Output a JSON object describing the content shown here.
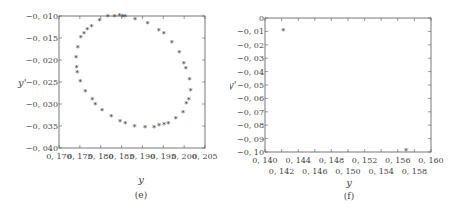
{
  "chart_data": [
    {
      "panel_label": "(e)",
      "type": "scatter",
      "title": "",
      "xlabel": "y",
      "ylabel": "y'",
      "xlim": [
        0.17,
        0.205
      ],
      "ylim": [
        -0.04,
        -0.01
      ],
      "xticks": [
        "0.170",
        "0.175",
        "0.180",
        "0.185",
        "0.190",
        "0.195",
        "0.200",
        "0.205"
      ],
      "yticks": [
        "-0.010",
        "-0.015",
        "-0.020",
        "-0.025",
        "-0.030",
        "-0.035",
        "-0.040"
      ],
      "grid": false,
      "marker": "*",
      "points": [
        [
          0.1741,
          -0.0195
        ],
        [
          0.1742,
          -0.0218
        ],
        [
          0.1744,
          -0.0229
        ],
        [
          0.1745,
          -0.0172
        ],
        [
          0.1752,
          -0.015
        ],
        [
          0.1751,
          -0.025
        ],
        [
          0.176,
          -0.014
        ],
        [
          0.1768,
          -0.0131
        ],
        [
          0.1763,
          -0.0273
        ],
        [
          0.1778,
          -0.0124
        ],
        [
          0.178,
          -0.029
        ],
        [
          0.1787,
          -0.0302
        ],
        [
          0.1797,
          -0.0112
        ],
        [
          0.1803,
          -0.0317
        ],
        [
          0.1817,
          -0.0103
        ],
        [
          0.1825,
          -0.033
        ],
        [
          0.1833,
          -0.0102
        ],
        [
          0.1845,
          -0.0101
        ],
        [
          0.1846,
          -0.0341
        ],
        [
          0.1852,
          -0.0102
        ],
        [
          0.1858,
          -0.0103
        ],
        [
          0.1859,
          -0.0346
        ],
        [
          0.1882,
          -0.0109
        ],
        [
          0.1881,
          -0.0353
        ],
        [
          0.1906,
          -0.0354
        ],
        [
          0.1912,
          -0.0118
        ],
        [
          0.1928,
          -0.0354
        ],
        [
          0.1939,
          -0.0134
        ],
        [
          0.194,
          -0.0351
        ],
        [
          0.1951,
          -0.0142
        ],
        [
          0.1952,
          -0.0348
        ],
        [
          0.1962,
          -0.0345
        ],
        [
          0.197,
          -0.0162
        ],
        [
          0.198,
          -0.0334
        ],
        [
          0.1988,
          -0.0184
        ],
        [
          0.1997,
          -0.032
        ],
        [
          0.1999,
          -0.0208
        ],
        [
          0.2005,
          -0.0301
        ],
        [
          0.2004,
          -0.022
        ],
        [
          0.2011,
          -0.029
        ],
        [
          0.2013,
          -0.0246
        ],
        [
          0.2015,
          -0.027
        ]
      ]
    },
    {
      "panel_label": "(f)",
      "type": "scatter",
      "title": "",
      "xlabel": "y",
      "ylabel": "y'",
      "xlim": [
        0.14,
        0.16
      ],
      "ylim": [
        -0.1,
        0
      ],
      "xticks_upper": [
        "0.140",
        "0.144",
        "0.148",
        "0.152",
        "0.156",
        "0.160"
      ],
      "xticks_lower": [
        "0.142",
        "0.146",
        "0.150",
        "0.154",
        "0.158"
      ],
      "yticks": [
        "0",
        "-0.01",
        "-0.02",
        "-0.03",
        "-0.04",
        "-0.05",
        "-0.06",
        "-0.07",
        "-0.08",
        "-0.09",
        "-0.10"
      ],
      "grid": false,
      "marker": "*",
      "points": [
        [
          0.1422,
          -0.01
        ],
        [
          0.157,
          -0.099
        ]
      ]
    }
  ]
}
